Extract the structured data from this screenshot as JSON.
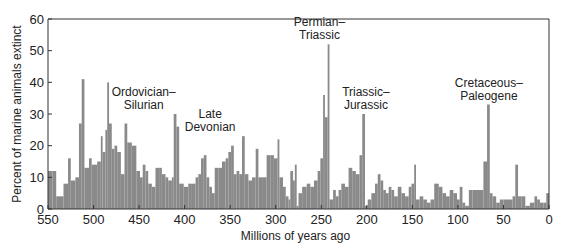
{
  "chart_data": {
    "type": "bar",
    "title": "",
    "xlabel": "Millions of years ago",
    "ylabel": "Percent of marine animals extinct",
    "xlim": [
      550,
      0
    ],
    "ylim": [
      0,
      60
    ],
    "xticks": [
      550,
      500,
      450,
      400,
      350,
      300,
      250,
      200,
      150,
      100,
      50,
      0
    ],
    "yticks": [
      0,
      10,
      20,
      30,
      40,
      50,
      60
    ],
    "grid": false,
    "bar_color": "#8a8a8a",
    "annotations": [
      {
        "line1": "Ordovician–",
        "line2": "Silurian",
        "x_myr": 445,
        "y_pct": 30
      },
      {
        "line1": "Late",
        "line2": "Devonian",
        "x_myr": 372,
        "y_pct": 23
      },
      {
        "line1": "Permian–",
        "line2": "Triassic",
        "x_myr": 252,
        "y_pct": 52
      },
      {
        "line1": "Triassic–",
        "line2": "Jurassic",
        "x_myr": 201,
        "y_pct": 30
      },
      {
        "line1": "Cretaceous–",
        "line2": "Paleogene",
        "x_myr": 66,
        "y_pct": 33
      }
    ],
    "bins": [
      {
        "start": 550,
        "end": 545,
        "value": 12
      },
      {
        "start": 545,
        "end": 541,
        "value": 12
      },
      {
        "start": 541,
        "end": 533,
        "value": 4
      },
      {
        "start": 533,
        "end": 528,
        "value": 8
      },
      {
        "start": 528,
        "end": 525,
        "value": 16
      },
      {
        "start": 525,
        "end": 520,
        "value": 9
      },
      {
        "start": 520,
        "end": 516,
        "value": 10
      },
      {
        "start": 516,
        "end": 513,
        "value": 27
      },
      {
        "start": 513,
        "end": 510,
        "value": 41
      },
      {
        "start": 510,
        "end": 505,
        "value": 13
      },
      {
        "start": 505,
        "end": 502,
        "value": 16
      },
      {
        "start": 502,
        "end": 496,
        "value": 14
      },
      {
        "start": 496,
        "end": 492,
        "value": 15
      },
      {
        "start": 492,
        "end": 490,
        "value": 23
      },
      {
        "start": 490,
        "end": 487,
        "value": 18
      },
      {
        "start": 487,
        "end": 485,
        "value": 25
      },
      {
        "start": 485,
        "end": 483,
        "value": 40
      },
      {
        "start": 483,
        "end": 480,
        "value": 27
      },
      {
        "start": 480,
        "end": 477,
        "value": 19
      },
      {
        "start": 477,
        "end": 474,
        "value": 20
      },
      {
        "start": 474,
        "end": 470,
        "value": 18
      },
      {
        "start": 470,
        "end": 466,
        "value": 11
      },
      {
        "start": 466,
        "end": 463,
        "value": 27
      },
      {
        "start": 463,
        "end": 458,
        "value": 21
      },
      {
        "start": 458,
        "end": 453,
        "value": 20
      },
      {
        "start": 453,
        "end": 449,
        "value": 12
      },
      {
        "start": 449,
        "end": 446,
        "value": 10
      },
      {
        "start": 446,
        "end": 443,
        "value": 14
      },
      {
        "start": 443,
        "end": 440,
        "value": 12
      },
      {
        "start": 440,
        "end": 436,
        "value": 8
      },
      {
        "start": 436,
        "end": 432,
        "value": 7
      },
      {
        "start": 432,
        "end": 428,
        "value": 13
      },
      {
        "start": 428,
        "end": 425,
        "value": 13
      },
      {
        "start": 425,
        "end": 421,
        "value": 11
      },
      {
        "start": 421,
        "end": 418,
        "value": 10
      },
      {
        "start": 418,
        "end": 414,
        "value": 9
      },
      {
        "start": 414,
        "end": 412,
        "value": 10
      },
      {
        "start": 412,
        "end": 409,
        "value": 30
      },
      {
        "start": 409,
        "end": 406,
        "value": 26
      },
      {
        "start": 406,
        "end": 401,
        "value": 8
      },
      {
        "start": 401,
        "end": 396,
        "value": 7
      },
      {
        "start": 396,
        "end": 392,
        "value": 8
      },
      {
        "start": 392,
        "end": 388,
        "value": 8
      },
      {
        "start": 388,
        "end": 385,
        "value": 10
      },
      {
        "start": 385,
        "end": 382,
        "value": 11
      },
      {
        "start": 382,
        "end": 379,
        "value": 16
      },
      {
        "start": 379,
        "end": 376,
        "value": 17
      },
      {
        "start": 376,
        "end": 373,
        "value": 10
      },
      {
        "start": 373,
        "end": 370,
        "value": 7
      },
      {
        "start": 370,
        "end": 367,
        "value": 5
      },
      {
        "start": 367,
        "end": 363,
        "value": 13
      },
      {
        "start": 363,
        "end": 359,
        "value": 13
      },
      {
        "start": 359,
        "end": 355,
        "value": 15
      },
      {
        "start": 355,
        "end": 352,
        "value": 16
      },
      {
        "start": 352,
        "end": 349,
        "value": 18
      },
      {
        "start": 349,
        "end": 346,
        "value": 20
      },
      {
        "start": 346,
        "end": 343,
        "value": 11
      },
      {
        "start": 343,
        "end": 340,
        "value": 12
      },
      {
        "start": 340,
        "end": 337,
        "value": 11
      },
      {
        "start": 337,
        "end": 334,
        "value": 23
      },
      {
        "start": 334,
        "end": 330,
        "value": 11
      },
      {
        "start": 330,
        "end": 326,
        "value": 9
      },
      {
        "start": 326,
        "end": 322,
        "value": 10
      },
      {
        "start": 322,
        "end": 319,
        "value": 19
      },
      {
        "start": 319,
        "end": 315,
        "value": 10
      },
      {
        "start": 315,
        "end": 310,
        "value": 10
      },
      {
        "start": 310,
        "end": 306,
        "value": 17
      },
      {
        "start": 306,
        "end": 302,
        "value": 17
      },
      {
        "start": 302,
        "end": 298,
        "value": 16
      },
      {
        "start": 298,
        "end": 296,
        "value": 22
      },
      {
        "start": 296,
        "end": 292,
        "value": 10
      },
      {
        "start": 292,
        "end": 289,
        "value": 7
      },
      {
        "start": 289,
        "end": 286,
        "value": 4
      },
      {
        "start": 286,
        "end": 284,
        "value": 3
      },
      {
        "start": 284,
        "end": 281,
        "value": 12
      },
      {
        "start": 281,
        "end": 279,
        "value": 9
      },
      {
        "start": 279,
        "end": 277,
        "value": 14
      },
      {
        "start": 277,
        "end": 275,
        "value": 1
      },
      {
        "start": 275,
        "end": 271,
        "value": 5
      },
      {
        "start": 271,
        "end": 266,
        "value": 7
      },
      {
        "start": 266,
        "end": 262,
        "value": 8
      },
      {
        "start": 262,
        "end": 258,
        "value": 7
      },
      {
        "start": 258,
        "end": 254,
        "value": 9
      },
      {
        "start": 254,
        "end": 251,
        "value": 12
      },
      {
        "start": 251,
        "end": 248,
        "value": 16
      },
      {
        "start": 248,
        "end": 246,
        "value": 36
      },
      {
        "start": 246,
        "end": 243,
        "value": 29
      },
      {
        "start": 243,
        "end": 241,
        "value": 52
      },
      {
        "start": 241,
        "end": 237,
        "value": 3
      },
      {
        "start": 237,
        "end": 234,
        "value": 6
      },
      {
        "start": 234,
        "end": 231,
        "value": 4
      },
      {
        "start": 231,
        "end": 228,
        "value": 6
      },
      {
        "start": 228,
        "end": 224,
        "value": 8
      },
      {
        "start": 224,
        "end": 220,
        "value": 7
      },
      {
        "start": 220,
        "end": 216,
        "value": 13
      },
      {
        "start": 216,
        "end": 212,
        "value": 12
      },
      {
        "start": 212,
        "end": 208,
        "value": 11
      },
      {
        "start": 208,
        "end": 205,
        "value": 17
      },
      {
        "start": 205,
        "end": 202,
        "value": 30
      },
      {
        "start": 202,
        "end": 199,
        "value": 1
      },
      {
        "start": 199,
        "end": 195,
        "value": 3
      },
      {
        "start": 195,
        "end": 191,
        "value": 5
      },
      {
        "start": 191,
        "end": 188,
        "value": 8
      },
      {
        "start": 188,
        "end": 185,
        "value": 11
      },
      {
        "start": 185,
        "end": 182,
        "value": 9
      },
      {
        "start": 182,
        "end": 179,
        "value": 6
      },
      {
        "start": 179,
        "end": 176,
        "value": 5
      },
      {
        "start": 176,
        "end": 173,
        "value": 7
      },
      {
        "start": 173,
        "end": 170,
        "value": 6
      },
      {
        "start": 170,
        "end": 166,
        "value": 4
      },
      {
        "start": 166,
        "end": 162,
        "value": 7
      },
      {
        "start": 162,
        "end": 158,
        "value": 5
      },
      {
        "start": 158,
        "end": 154,
        "value": 4
      },
      {
        "start": 154,
        "end": 151,
        "value": 7
      },
      {
        "start": 151,
        "end": 148,
        "value": 8
      },
      {
        "start": 148,
        "end": 146,
        "value": 14
      },
      {
        "start": 146,
        "end": 142,
        "value": 3
      },
      {
        "start": 142,
        "end": 138,
        "value": 4
      },
      {
        "start": 138,
        "end": 134,
        "value": 3
      },
      {
        "start": 134,
        "end": 130,
        "value": 2
      },
      {
        "start": 130,
        "end": 126,
        "value": 3
      },
      {
        "start": 126,
        "end": 121,
        "value": 8
      },
      {
        "start": 121,
        "end": 117,
        "value": 7
      },
      {
        "start": 117,
        "end": 113,
        "value": 5
      },
      {
        "start": 113,
        "end": 109,
        "value": 4
      },
      {
        "start": 109,
        "end": 105,
        "value": 6
      },
      {
        "start": 105,
        "end": 101,
        "value": 5
      },
      {
        "start": 101,
        "end": 98,
        "value": 3
      },
      {
        "start": 98,
        "end": 95,
        "value": 7
      },
      {
        "start": 95,
        "end": 92,
        "value": 2
      },
      {
        "start": 92,
        "end": 88,
        "value": 1
      },
      {
        "start": 88,
        "end": 84,
        "value": 6
      },
      {
        "start": 84,
        "end": 78,
        "value": 6
      },
      {
        "start": 78,
        "end": 72,
        "value": 6
      },
      {
        "start": 72,
        "end": 68,
        "value": 15
      },
      {
        "start": 68,
        "end": 65,
        "value": 33
      },
      {
        "start": 65,
        "end": 62,
        "value": 5
      },
      {
        "start": 62,
        "end": 58,
        "value": 4
      },
      {
        "start": 58,
        "end": 54,
        "value": 2
      },
      {
        "start": 54,
        "end": 50,
        "value": 3
      },
      {
        "start": 50,
        "end": 45,
        "value": 3
      },
      {
        "start": 45,
        "end": 40,
        "value": 3
      },
      {
        "start": 40,
        "end": 37,
        "value": 4
      },
      {
        "start": 37,
        "end": 34,
        "value": 14
      },
      {
        "start": 34,
        "end": 30,
        "value": 4
      },
      {
        "start": 30,
        "end": 26,
        "value": 4
      },
      {
        "start": 26,
        "end": 21,
        "value": 1
      },
      {
        "start": 21,
        "end": 16,
        "value": 2
      },
      {
        "start": 16,
        "end": 13,
        "value": 4
      },
      {
        "start": 13,
        "end": 10,
        "value": 3
      },
      {
        "start": 10,
        "end": 6,
        "value": 2
      },
      {
        "start": 6,
        "end": 3,
        "value": 2
      },
      {
        "start": 3,
        "end": 0,
        "value": 5
      }
    ]
  }
}
